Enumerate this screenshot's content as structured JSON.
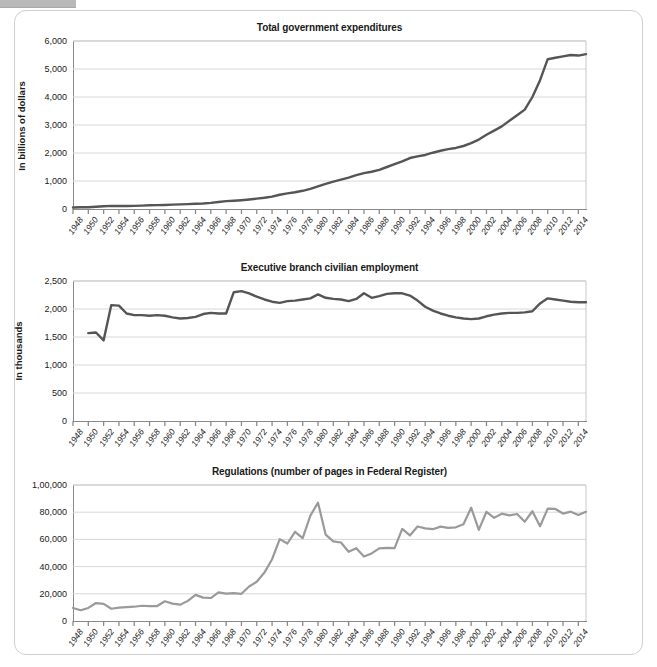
{
  "page": {
    "background_color": "#ffffff",
    "frame_border_color": "#cfcfcf",
    "dark_series_color": "#555555",
    "light_series_color": "#9a9a9a",
    "grid_color": "#d8d8d8",
    "axis_color": "#8a8a8a"
  },
  "charts": [
    {
      "id": "total-government-expenditures",
      "title": "Total government expenditures",
      "ylabel": "In billions of dollars",
      "yticks": [
        "0",
        "1,000",
        "2,000",
        "3,000",
        "4,000",
        "5,000",
        "6,000"
      ],
      "xticks": [
        "1948",
        "1950",
        "1952",
        "1954",
        "1956",
        "1958",
        "1960",
        "1962",
        "1964",
        "1966",
        "1968",
        "1970",
        "1972",
        "1974",
        "1976",
        "1978",
        "1980",
        "1982",
        "1984",
        "1986",
        "1988",
        "1990",
        "1992",
        "1994",
        "1996",
        "1998",
        "2000",
        "2002",
        "2004",
        "2006",
        "2008",
        "2010",
        "2012",
        "2014"
      ],
      "series_color": "#555555"
    },
    {
      "id": "executive-branch-civilian-employment",
      "title": "Executive branch civilian employment",
      "ylabel": "In thousands",
      "yticks": [
        "0",
        "500",
        "1,000",
        "1,500",
        "2,000",
        "2,500"
      ],
      "xticks": [
        "1948",
        "1950",
        "1952",
        "1954",
        "1956",
        "1958",
        "1960",
        "1962",
        "1964",
        "1966",
        "1968",
        "1970",
        "1972",
        "1974",
        "1976",
        "1978",
        "1980",
        "1982",
        "1984",
        "1986",
        "1988",
        "1990",
        "1992",
        "1994",
        "1996",
        "1998",
        "2000",
        "2002",
        "2004",
        "2006",
        "2008",
        "2010",
        "2012",
        "2014"
      ],
      "series_color": "#555555"
    },
    {
      "id": "regulations-federal-register-pages",
      "title": "Regulations (number of pages in Federal Register)",
      "ylabel": "",
      "yticks": [
        "0",
        "20,000",
        "40,000",
        "60,000",
        "80,000",
        "1,00,000"
      ],
      "xticks": [
        "1948",
        "1950",
        "1952",
        "1954",
        "1956",
        "1958",
        "1960",
        "1962",
        "1964",
        "1966",
        "1968",
        "1970",
        "1972",
        "1974",
        "1976",
        "1978",
        "1980",
        "1982",
        "1984",
        "1986",
        "1988",
        "1990",
        "1992",
        "1994",
        "1996",
        "1998",
        "2000",
        "2002",
        "2004",
        "2006",
        "2008",
        "2010",
        "2012",
        "2014"
      ],
      "series_color": "#9a9a9a"
    }
  ],
  "chart_data": [
    {
      "type": "line",
      "title": "Total government expenditures",
      "xlabel": "",
      "ylabel": "In billions of dollars",
      "ylim": [
        0,
        6000
      ],
      "xlim": [
        1948,
        2015
      ],
      "grid": true,
      "legend": "none",
      "x": [
        1948,
        1949,
        1950,
        1951,
        1952,
        1953,
        1954,
        1955,
        1956,
        1957,
        1958,
        1959,
        1960,
        1961,
        1962,
        1963,
        1964,
        1965,
        1966,
        1967,
        1968,
        1969,
        1970,
        1971,
        1972,
        1973,
        1974,
        1975,
        1976,
        1977,
        1978,
        1979,
        1980,
        1981,
        1982,
        1983,
        1984,
        1985,
        1986,
        1987,
        1988,
        1989,
        1990,
        1991,
        1992,
        1993,
        1994,
        1995,
        1996,
        1997,
        1998,
        1999,
        2000,
        2001,
        2002,
        2003,
        2004,
        2005,
        2006,
        2007,
        2008,
        2009,
        2010,
        2011,
        2012,
        2013,
        2014,
        2015
      ],
      "series": [
        {
          "name": "Total government expenditures",
          "color": "#555555",
          "values": [
            55,
            62,
            63,
            79,
            100,
            110,
            105,
            108,
            112,
            122,
            133,
            137,
            144,
            155,
            166,
            175,
            186,
            197,
            220,
            250,
            280,
            295,
            315,
            340,
            370,
            400,
            440,
            510,
            560,
            600,
            650,
            720,
            810,
            900,
            980,
            1050,
            1120,
            1210,
            1280,
            1330,
            1400,
            1500,
            1600,
            1700,
            1820,
            1880,
            1930,
            2010,
            2080,
            2140,
            2180,
            2250,
            2350,
            2480,
            2650,
            2800,
            2950,
            3150,
            3350,
            3550,
            4000,
            4600,
            5350,
            5400,
            5450,
            5500,
            5480,
            5530
          ]
        }
      ]
    },
    {
      "type": "line",
      "title": "Executive branch civilian employment",
      "xlabel": "",
      "ylabel": "In thousands",
      "ylim": [
        0,
        2500
      ],
      "xlim": [
        1948,
        2015
      ],
      "grid": true,
      "legend": "none",
      "x": [
        1950,
        1951,
        1952,
        1953,
        1954,
        1955,
        1956,
        1957,
        1958,
        1959,
        1960,
        1961,
        1962,
        1963,
        1964,
        1965,
        1966,
        1967,
        1968,
        1969,
        1970,
        1971,
        1972,
        1973,
        1974,
        1975,
        1976,
        1977,
        1978,
        1979,
        1980,
        1981,
        1982,
        1983,
        1984,
        1985,
        1986,
        1987,
        1988,
        1989,
        1990,
        1991,
        1992,
        1993,
        1994,
        1995,
        1996,
        1997,
        1998,
        1999,
        2000,
        2001,
        2002,
        2003,
        2004,
        2005,
        2006,
        2007,
        2008,
        2009,
        2010,
        2011,
        2012,
        2013,
        2014,
        2015
      ],
      "series": [
        {
          "name": "Executive branch civilian employment",
          "color": "#555555",
          "values": [
            1570,
            1580,
            1440,
            2070,
            2060,
            1920,
            1890,
            1890,
            1880,
            1890,
            1880,
            1850,
            1830,
            1840,
            1860,
            1910,
            1930,
            1920,
            1920,
            2300,
            2320,
            2280,
            2220,
            2170,
            2130,
            2110,
            2140,
            2150,
            2170,
            2190,
            2260,
            2200,
            2180,
            2170,
            2140,
            2180,
            2280,
            2200,
            2230,
            2270,
            2280,
            2280,
            2240,
            2150,
            2040,
            1970,
            1920,
            1880,
            1850,
            1830,
            1820,
            1830,
            1870,
            1900,
            1920,
            1930,
            1930,
            1940,
            1960,
            2100,
            2190,
            2170,
            2150,
            2130,
            2120,
            2120
          ]
        }
      ]
    },
    {
      "type": "line",
      "title": "Regulations (number of pages in Federal Register)",
      "xlabel": "",
      "ylabel": "",
      "ylim": [
        0,
        100000
      ],
      "xlim": [
        1948,
        2015
      ],
      "grid": true,
      "legend": "none",
      "x": [
        1948,
        1949,
        1950,
        1951,
        1952,
        1953,
        1954,
        1955,
        1956,
        1957,
        1958,
        1959,
        1960,
        1961,
        1962,
        1963,
        1964,
        1965,
        1966,
        1967,
        1968,
        1969,
        1970,
        1971,
        1972,
        1973,
        1974,
        1975,
        1976,
        1977,
        1978,
        1979,
        1980,
        1981,
        1982,
        1983,
        1984,
        1985,
        1986,
        1987,
        1988,
        1989,
        1990,
        1991,
        1992,
        1993,
        1994,
        1995,
        1996,
        1997,
        1998,
        1999,
        2000,
        2001,
        2002,
        2003,
        2004,
        2005,
        2006,
        2007,
        2008,
        2009,
        2010,
        2011,
        2012,
        2013,
        2014,
        2015
      ],
      "series": [
        {
          "name": "Pages in Federal Register",
          "color": "#9a9a9a",
          "values": [
            9600,
            7900,
            9600,
            13200,
            12600,
            9000,
            9900,
            10200,
            10500,
            11200,
            10900,
            11000,
            14500,
            12800,
            12000,
            14800,
            19200,
            17200,
            16900,
            21000,
            20100,
            20500,
            20000,
            25400,
            28900,
            35600,
            45400,
            60200,
            57000,
            65600,
            61000,
            77500,
            87000,
            63500,
            58500,
            57700,
            50900,
            53500,
            47400,
            49700,
            53400,
            53800,
            53600,
            67700,
            62900,
            69500,
            68100,
            67500,
            69400,
            68500,
            68900,
            71100,
            83300,
            67000,
            80300,
            75800,
            78900,
            77700,
            78700,
            73000,
            80700,
            69700,
            82600,
            82400,
            79000,
            80400,
            78000,
            80300
          ]
        }
      ]
    }
  ]
}
